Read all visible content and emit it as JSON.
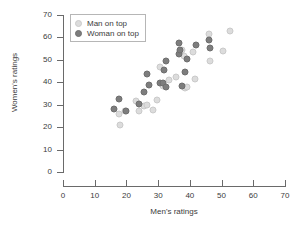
{
  "chart_data": {
    "type": "scatter",
    "title": "",
    "xlabel": "Men's ratings",
    "ylabel": "Women's ratings",
    "xlim": [
      0,
      70
    ],
    "ylim": [
      0,
      70
    ],
    "xticks": [
      0,
      10,
      20,
      30,
      40,
      50,
      60,
      70
    ],
    "yticks": [
      0,
      10,
      20,
      30,
      40,
      50,
      60,
      70
    ],
    "grid": false,
    "legend_position": "upper-left-inside",
    "series": [
      {
        "name": "Man on top",
        "marker": "circle",
        "color": "#dcdcdc",
        "points": [
          [
            18.0,
            21.0
          ],
          [
            17.5,
            26.0
          ],
          [
            19.5,
            27.0
          ],
          [
            23.0,
            31.5
          ],
          [
            24.0,
            27.0
          ],
          [
            25.5,
            29.5
          ],
          [
            26.5,
            30.0
          ],
          [
            28.5,
            27.5
          ],
          [
            29.5,
            32.0
          ],
          [
            30.5,
            47.0
          ],
          [
            31.5,
            38.5
          ],
          [
            33.5,
            41.0
          ],
          [
            35.5,
            42.5
          ],
          [
            37.0,
            53.0
          ],
          [
            37.5,
            54.5
          ],
          [
            38.0,
            51.5
          ],
          [
            38.5,
            37.5
          ],
          [
            39.0,
            38.0
          ],
          [
            41.0,
            53.5
          ],
          [
            41.5,
            41.5
          ],
          [
            46.0,
            61.5
          ],
          [
            46.5,
            49.5
          ],
          [
            50.5,
            54.0
          ],
          [
            52.5,
            63.0
          ]
        ]
      },
      {
        "name": "Woman on top",
        "marker": "circle",
        "color": "#7d7d7d",
        "points": [
          [
            16.0,
            28.0
          ],
          [
            17.5,
            32.5
          ],
          [
            20.0,
            27.0
          ],
          [
            24.0,
            30.5
          ],
          [
            25.5,
            35.5
          ],
          [
            26.5,
            43.5
          ],
          [
            27.0,
            39.0
          ],
          [
            30.5,
            39.5
          ],
          [
            31.5,
            39.5
          ],
          [
            32.0,
            45.5
          ],
          [
            32.5,
            49.5
          ],
          [
            32.5,
            38.0
          ],
          [
            36.5,
            57.5
          ],
          [
            36.5,
            52.5
          ],
          [
            37.0,
            54.5
          ],
          [
            37.5,
            38.5
          ],
          [
            38.5,
            44.5
          ],
          [
            39.0,
            50.5
          ],
          [
            42.0,
            56.5
          ],
          [
            46.0,
            59.0
          ],
          [
            46.5,
            55.5
          ]
        ]
      }
    ]
  },
  "legend": {
    "items": [
      {
        "label": "Man on top",
        "key": "man"
      },
      {
        "label": "Woman on top",
        "key": "woman"
      }
    ]
  },
  "colors": {
    "man_on_top": "#dcdcdc",
    "woman_on_top": "#7d7d7d",
    "axis": "#6a6a6a",
    "text": "#3b3b3b",
    "background": "#ffffff"
  }
}
